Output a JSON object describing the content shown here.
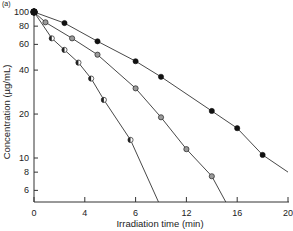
{
  "panel_label": "(a)",
  "chart_data": {
    "type": "line",
    "title": "",
    "xlabel": "Irradiation time (min)",
    "ylabel": "Concentration (µg/mL)",
    "yscale": "log",
    "xlim": [
      0,
      20
    ],
    "ylim": [
      5,
      100
    ],
    "x_ticks": [
      0,
      4,
      8,
      12,
      16,
      20
    ],
    "x_tick_labels": [
      "0",
      "4",
      "6",
      "12",
      "16",
      "20"
    ],
    "y_ticks": [
      100,
      80,
      60,
      40,
      20,
      10,
      8,
      6
    ],
    "y_tick_labels": [
      "100",
      "80",
      "60",
      "40",
      "20",
      "10",
      "8",
      "6"
    ],
    "grid": false,
    "legend": null,
    "series": [
      {
        "name": "filled circles",
        "marker": "filled",
        "x": [
          0,
          2.4,
          5,
          8,
          10,
          14,
          16,
          18
        ],
        "y": [
          100,
          84,
          63,
          46,
          36,
          21,
          16,
          10.5
        ],
        "curve_end": [
          20,
          8
        ]
      },
      {
        "name": "grey circles",
        "marker": "grey",
        "x": [
          0,
          0.9,
          3,
          5,
          8,
          10,
          12,
          14
        ],
        "y": [
          100,
          85,
          66,
          51,
          30,
          19,
          11.5,
          7.5
        ],
        "curve_end": [
          15.1,
          5
        ]
      },
      {
        "name": "half-filled circles",
        "marker": "half",
        "x": [
          0,
          1.4,
          2.4,
          3.5,
          4.5,
          5.5,
          7.6
        ],
        "y": [
          100,
          66,
          55,
          45,
          35,
          25,
          13.3
        ],
        "curve_end": [
          9.8,
          5
        ]
      }
    ]
  }
}
